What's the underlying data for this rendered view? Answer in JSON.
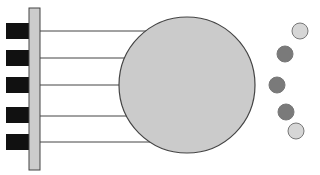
{
  "diagram": {
    "colors": {
      "background": "#ffffff",
      "bar_fill": "#cccccc",
      "stroke": "#444444",
      "block_fill": "#111111",
      "big_circle_fill": "#cbcbcb",
      "dot_dark": "#7a7a7a",
      "dot_light": "#d6d6d6"
    },
    "bar": {
      "x": 29,
      "y": 8,
      "width": 11,
      "height": 162
    },
    "blocks": [
      {
        "y": 23,
        "height": 16
      },
      {
        "y": 50,
        "height": 16
      },
      {
        "y": 77,
        "height": 16
      },
      {
        "y": 107,
        "height": 16
      },
      {
        "y": 134,
        "height": 16
      }
    ],
    "lines": [
      {
        "y": 31,
        "x2": 150
      },
      {
        "y": 58,
        "x2": 126
      },
      {
        "y": 85,
        "x2": 119
      },
      {
        "y": 116,
        "x2": 125
      },
      {
        "y": 142,
        "x2": 148
      }
    ],
    "big_circle": {
      "cx": 187,
      "cy": 85,
      "r": 68
    },
    "dots": [
      {
        "cx": 300,
        "cy": 31,
        "r": 8,
        "tone": "light"
      },
      {
        "cx": 285,
        "cy": 54,
        "r": 8,
        "tone": "dark"
      },
      {
        "cx": 277,
        "cy": 85,
        "r": 8,
        "tone": "dark"
      },
      {
        "cx": 286,
        "cy": 112,
        "r": 8,
        "tone": "dark"
      },
      {
        "cx": 296,
        "cy": 131,
        "r": 8,
        "tone": "light"
      }
    ]
  }
}
